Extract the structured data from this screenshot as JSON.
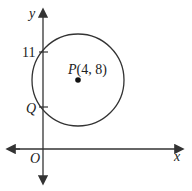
{
  "diagram": {
    "axes": {
      "x_label": "x",
      "y_label": "y",
      "origin_label": "O"
    },
    "y_tick_label": "11",
    "point_label_prefix": "P",
    "point_coords": "(4, 8)",
    "intercept_label": "Q",
    "circle": {
      "center": [
        4,
        8
      ],
      "y_intercepts": [
        "11",
        "Q"
      ]
    }
  }
}
